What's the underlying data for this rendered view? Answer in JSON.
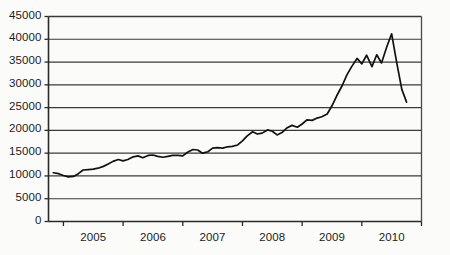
{
  "chart_data": {
    "type": "line",
    "title": "",
    "subtitle": "",
    "xlabel": "",
    "ylabel": "",
    "grid": true,
    "legend": false,
    "legend_position": "none",
    "xlim": [
      2004.5,
      2010.75
    ],
    "ylim": [
      0,
      45000
    ],
    "ytick_labels": [
      "45000",
      "40000",
      "35000",
      "30000",
      "25000",
      "20000",
      "15000",
      "10000",
      "5000",
      "0"
    ],
    "ytick_values": [
      45000,
      40000,
      35000,
      30000,
      25000,
      20000,
      15000,
      10000,
      5000,
      0
    ],
    "xtick_labels": [
      "2005",
      "2006",
      "2007",
      "2008",
      "2009",
      "2010"
    ],
    "xtick_values": [
      2005,
      2006,
      2007,
      2008,
      2009,
      2010
    ],
    "series": [
      {
        "name": "value",
        "color": "#111111",
        "x": [
          2004.58,
          2004.67,
          2004.75,
          2004.83,
          2004.92,
          2005.0,
          2005.08,
          2005.17,
          2005.25,
          2005.33,
          2005.42,
          2005.5,
          2005.58,
          2005.67,
          2005.75,
          2005.83,
          2005.92,
          2006.0,
          2006.08,
          2006.17,
          2006.25,
          2006.33,
          2006.42,
          2006.5,
          2006.58,
          2006.67,
          2006.75,
          2006.83,
          2006.92,
          2007.0,
          2007.08,
          2007.17,
          2007.25,
          2007.33,
          2007.42,
          2007.5,
          2007.58,
          2007.67,
          2007.75,
          2007.83,
          2007.92,
          2008.0,
          2008.08,
          2008.17,
          2008.25,
          2008.33,
          2008.42,
          2008.5,
          2008.58,
          2008.67,
          2008.75,
          2008.83,
          2008.92,
          2009.0,
          2009.08,
          2009.17,
          2009.25,
          2009.33,
          2009.42,
          2009.5,
          2009.58,
          2009.67,
          2009.75,
          2009.83,
          2009.92,
          2010.0,
          2010.08,
          2010.17,
          2010.25,
          2010.33,
          2010.42,
          2010.5
        ],
        "values": [
          10700,
          10500,
          10100,
          9800,
          9900,
          10500,
          11300,
          11400,
          11500,
          11700,
          12100,
          12600,
          13200,
          13600,
          13300,
          13600,
          14200,
          14400,
          14000,
          14500,
          14600,
          14300,
          14100,
          14300,
          14500,
          14500,
          14400,
          15200,
          15800,
          15700,
          15000,
          15300,
          16100,
          16200,
          16100,
          16400,
          16500,
          16800,
          17700,
          18800,
          19700,
          19200,
          19400,
          20100,
          19800,
          19000,
          19600,
          20600,
          21100,
          20700,
          21400,
          22300,
          22200,
          22700,
          23000,
          23600,
          25400,
          27600,
          29800,
          32200,
          34000,
          35800,
          34600,
          36500,
          34000,
          36600,
          34800,
          38400,
          41200,
          35200,
          29000,
          26200
        ]
      }
    ],
    "annotations": []
  },
  "axes": {
    "y_axis_name": "value-axis",
    "x_axis_name": "year-axis"
  }
}
